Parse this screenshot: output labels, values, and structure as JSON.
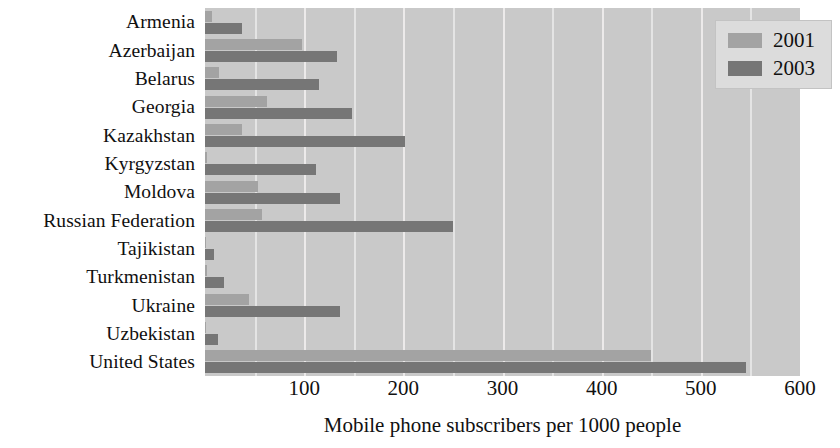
{
  "chart_data": {
    "type": "bar",
    "orientation": "horizontal",
    "title": "",
    "xlabel": "Mobile phone subscribers per 1000 people",
    "ylabel": "",
    "xlim": [
      0,
      600
    ],
    "xticks": [
      100,
      200,
      300,
      400,
      500,
      600
    ],
    "xtick_labels": [
      "100",
      "200",
      "300",
      "400",
      "500",
      "600"
    ],
    "grid": true,
    "minor_gridline_step": 50,
    "legend_position": "top-right",
    "categories": [
      "Armenia",
      "Azerbaijan",
      "Belarus",
      "Georgia",
      "Kazakhstan",
      "Kyrgyzstan",
      "Moldova",
      "Russian Federation",
      "Tajikistan",
      "Turkmenistan",
      "Ukraine",
      "Uzbekistan",
      "United States"
    ],
    "series": [
      {
        "name": "2001",
        "color": "#a3a3a3",
        "values": [
          7,
          98,
          14,
          63,
          37,
          2,
          53,
          57,
          1,
          2,
          44,
          1,
          450
        ]
      },
      {
        "name": "2003",
        "color": "#767676",
        "values": [
          37,
          133,
          115,
          148,
          202,
          112,
          136,
          250,
          9,
          19,
          136,
          13,
          546
        ]
      }
    ]
  },
  "legend": {
    "items": [
      {
        "label": "2001",
        "swatch": "legend-swatch-2001"
      },
      {
        "label": "2003",
        "swatch": "legend-swatch-2003"
      }
    ]
  },
  "colors": {
    "plot_background": "#c9c9c9",
    "gridline": "#e9e7e7",
    "series_2001": "#a3a3a3",
    "series_2003": "#767676",
    "text": "#111111",
    "page_background": "#ffffff"
  }
}
